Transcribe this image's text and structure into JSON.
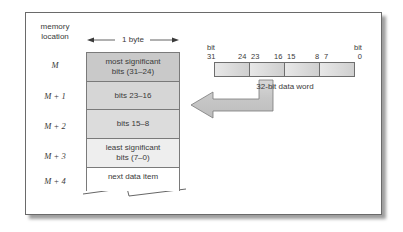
{
  "figure": {
    "memory_location_label": [
      "memory",
      "location"
    ],
    "byte_width_label": "1 byte",
    "memory_rows": [
      {
        "address": "M",
        "content_lines": [
          "most significant",
          "bits (31–24)"
        ],
        "fill": "#c9c9c9"
      },
      {
        "address": "M + 1",
        "content_lines": [
          "bits 23–16"
        ],
        "fill": "#d6d6d6"
      },
      {
        "address": "M + 2",
        "content_lines": [
          "bits 15–8"
        ],
        "fill": "#dcdcdc"
      },
      {
        "address": "M + 3",
        "content_lines": [
          "least significant",
          "bits (7–0)"
        ],
        "fill": "#eeeeee"
      },
      {
        "address": "M + 4",
        "content_lines": [
          "next data item"
        ],
        "fill": "#ffffff"
      }
    ],
    "data_word": {
      "caption": "32-bit data word",
      "left_label": [
        "bit",
        "31"
      ],
      "right_label": [
        "bit",
        "0"
      ],
      "boundary_labels": [
        "24",
        "23",
        "16",
        "15",
        "8",
        "7"
      ],
      "segments": 4
    },
    "arrow": {
      "from": "data word byte 15–8",
      "to": "M + 2",
      "fill": "#cccccc"
    }
  }
}
